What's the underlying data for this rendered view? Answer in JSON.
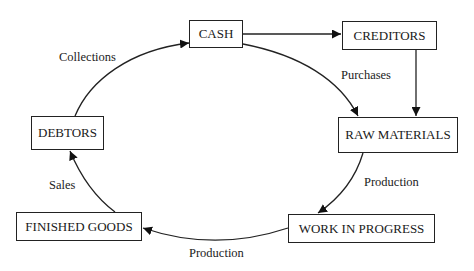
{
  "diagram": {
    "nodes": {
      "cash": "CASH",
      "creditors": "CREDITORS",
      "raw_materials": "RAW MATERIALS",
      "work_in_progress": "WORK IN PROGRESS",
      "finished_goods": "FINISHED GOODS",
      "debtors": "DEBTORS"
    },
    "edges": {
      "cash_creditors": "",
      "creditors_raw_materials": "",
      "cash_raw_materials": "Purchases",
      "raw_materials_wip": "Production",
      "wip_finished_goods": "Production",
      "finished_goods_debtors": "Sales",
      "debtors_cash": "Collections"
    },
    "colors": {
      "line": "#222222",
      "background": "#ffffff"
    }
  }
}
